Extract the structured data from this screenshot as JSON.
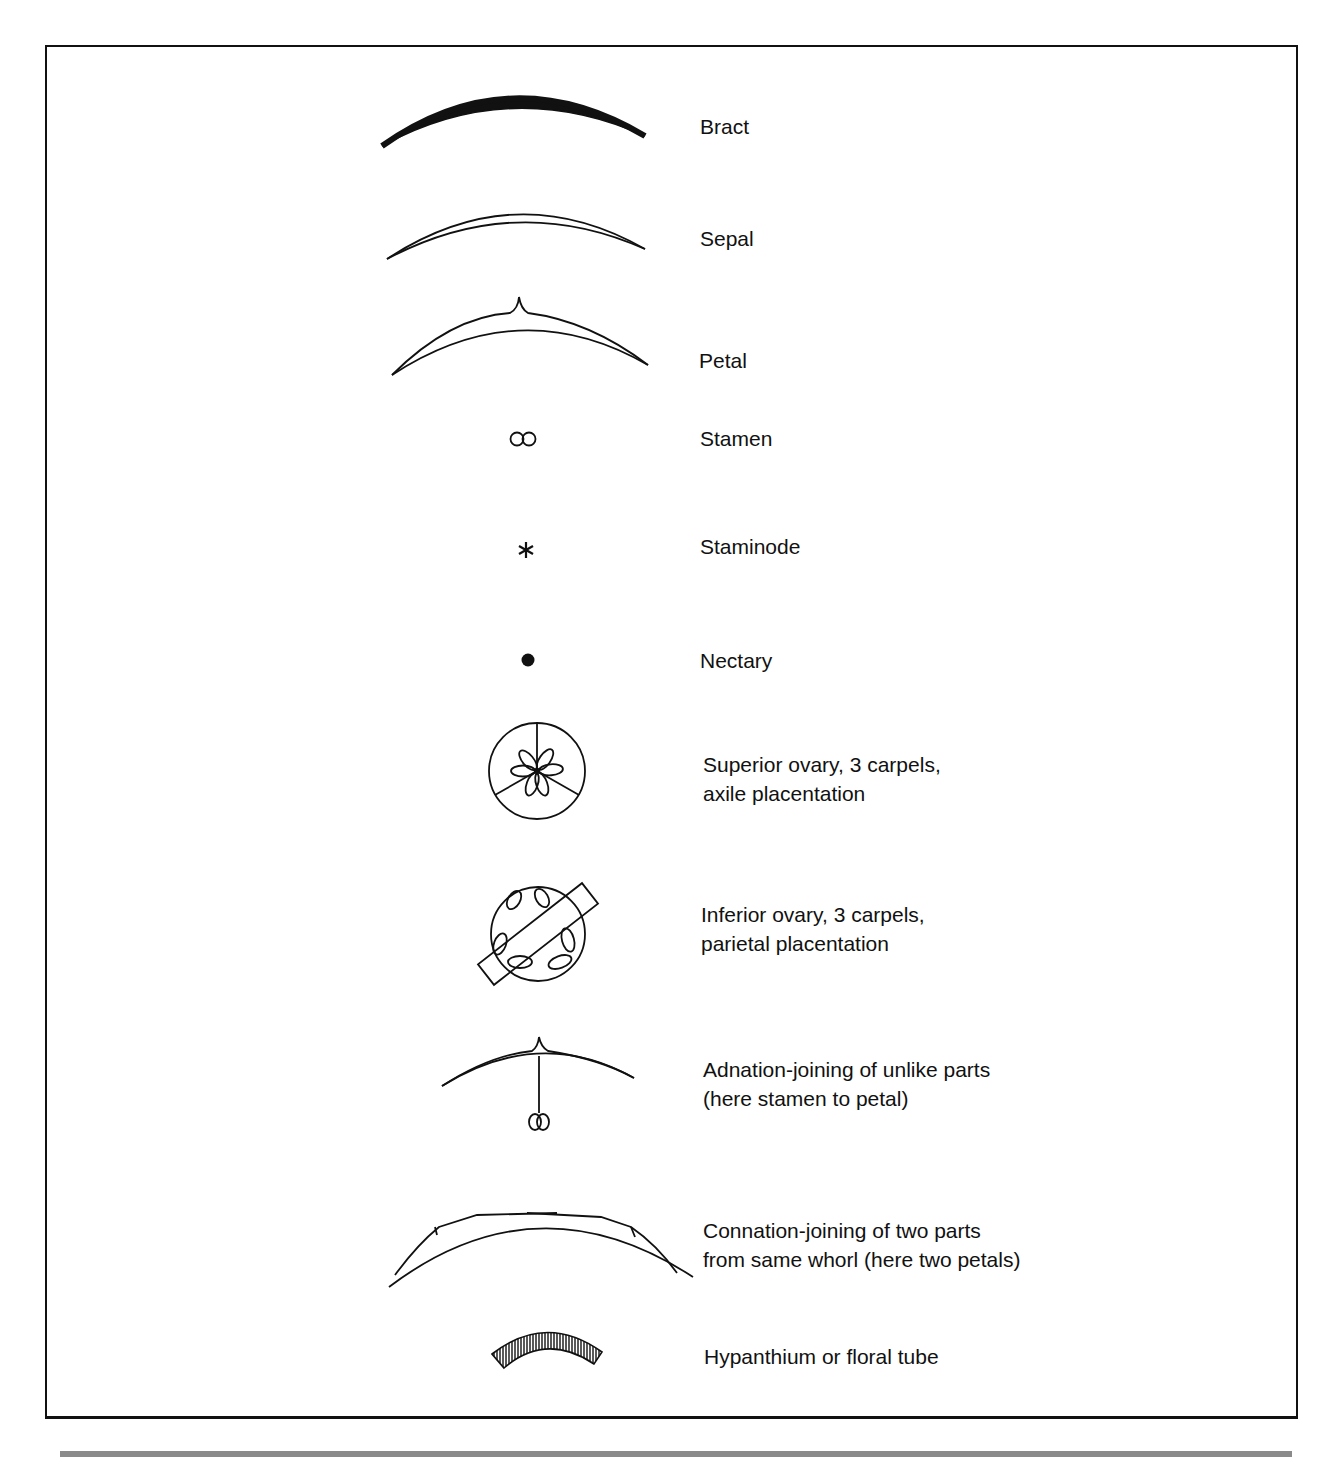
{
  "legend": {
    "items": [
      {
        "key": "bract",
        "label": "Bract",
        "symbol": "bract-icon"
      },
      {
        "key": "sepal",
        "label": "Sepal",
        "symbol": "sepal-icon"
      },
      {
        "key": "petal",
        "label": "Petal",
        "symbol": "petal-icon"
      },
      {
        "key": "stamen",
        "label": "Stamen",
        "symbol": "stamen-icon"
      },
      {
        "key": "staminode",
        "label": "Staminode",
        "symbol": "staminode-icon"
      },
      {
        "key": "nectary",
        "label": "Nectary",
        "symbol": "nectary-icon"
      },
      {
        "key": "superior_ovary",
        "label_line1": "Superior ovary, 3 carpels,",
        "label_line2": "axile placentation",
        "symbol": "superior-ovary-icon"
      },
      {
        "key": "inferior_ovary",
        "label_line1": "Inferior ovary, 3 carpels,",
        "label_line2": "parietal placentation",
        "symbol": "inferior-ovary-icon"
      },
      {
        "key": "adnation",
        "label_line1": "Adnation-joining of unlike parts",
        "label_line2": "(here stamen to petal)",
        "symbol": "adnation-icon"
      },
      {
        "key": "connation",
        "label_line1": "Connation-joining of two parts",
        "label_line2": "from same whorl (here two petals)",
        "symbol": "connation-icon"
      },
      {
        "key": "hypanthium",
        "label": "Hypanthium or floral tube",
        "symbol": "hypanthium-icon"
      }
    ]
  },
  "colors": {
    "ink": "#111111",
    "rule": "#8a8a8a",
    "background": "#ffffff"
  }
}
